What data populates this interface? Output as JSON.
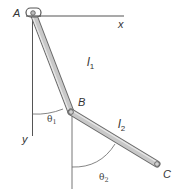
{
  "diagram": {
    "points": {
      "A": {
        "label": "A",
        "x": 33,
        "y": 13
      },
      "B": {
        "label": "B",
        "x": 71,
        "y": 112
      },
      "C": {
        "label": "C",
        "x": 157,
        "y": 164
      }
    },
    "axes": {
      "x_label": "x",
      "y_label": "y"
    },
    "links": [
      {
        "name": "l1",
        "label": "l",
        "subscript": "1",
        "from": "A",
        "to": "B"
      },
      {
        "name": "l2",
        "label": "l",
        "subscript": "2",
        "from": "B",
        "to": "C"
      }
    ],
    "angles": [
      {
        "name": "theta1",
        "label": "θ",
        "subscript": "1",
        "vertex": "A"
      },
      {
        "name": "theta2",
        "label": "θ",
        "subscript": "2",
        "vertex": "B"
      }
    ],
    "colors": {
      "rod_fill": "#c8c8c8",
      "rod_edge": "#6a6a6a",
      "axis_line": "#555555",
      "text": "#333333"
    }
  }
}
